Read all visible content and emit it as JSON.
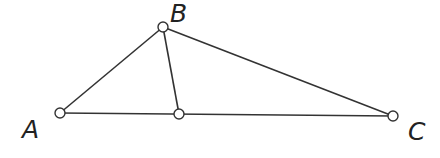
{
  "diagram": {
    "points": [
      {
        "id": "A",
        "label": "A",
        "x": 60,
        "y": 113,
        "label_x": 22,
        "label_y": 138
      },
      {
        "id": "B",
        "label": "B",
        "x": 163,
        "y": 27,
        "label_x": 170,
        "label_y": 22
      },
      {
        "id": "D",
        "label": "",
        "x": 179,
        "y": 114,
        "label_x": 0,
        "label_y": 0
      },
      {
        "id": "C",
        "label": "C",
        "x": 393,
        "y": 116,
        "label_x": 408,
        "label_y": 140
      }
    ],
    "segments": [
      {
        "from": "A",
        "to": "B"
      },
      {
        "from": "B",
        "to": "C"
      },
      {
        "from": "A",
        "to": "C"
      },
      {
        "from": "B",
        "to": "D"
      }
    ],
    "colors": {
      "stroke": "#333333",
      "point_fill": "#ffffff",
      "label": "#222222"
    }
  }
}
